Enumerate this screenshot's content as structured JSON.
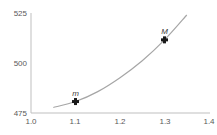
{
  "chart_data": {
    "type": "line",
    "title": "",
    "xlabel": "",
    "ylabel": "",
    "xlim": [
      1.0,
      1.4
    ],
    "ylim": [
      475,
      525
    ],
    "x_ticks": [
      "1.0",
      "1.1",
      "1.2",
      "1.3",
      "1.4"
    ],
    "y_ticks": [
      "475",
      "500",
      "525"
    ],
    "grid": false,
    "legend": null,
    "series": [
      {
        "name": "curve",
        "x": [
          1.05,
          1.1,
          1.15,
          1.2,
          1.25,
          1.3,
          1.35
        ],
        "y": [
          477.5,
          480.5,
          485.5,
          492.5,
          501,
          511.5,
          524
        ],
        "color": "#a6a6a6"
      }
    ],
    "annotations": [
      {
        "label": "m",
        "x": 1.1,
        "y": 480.5,
        "marker": "plus"
      },
      {
        "label": "M",
        "x": 1.3,
        "y": 511.5,
        "marker": "plus"
      }
    ]
  }
}
